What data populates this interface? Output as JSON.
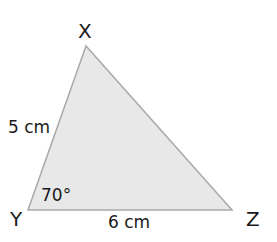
{
  "diagram": {
    "type": "triangle",
    "fill_color": "#e8e8e8",
    "stroke_color": "#a9a9a9",
    "text_color": "#1a1a1a",
    "vertices": [
      {
        "name": "X",
        "label": "X"
      },
      {
        "name": "Y",
        "label": "Y"
      },
      {
        "name": "Z",
        "label": "Z"
      }
    ],
    "sides": [
      {
        "between": "XY",
        "label": "5 cm"
      },
      {
        "between": "YZ",
        "label": "6 cm"
      }
    ],
    "angles": [
      {
        "at": "Y",
        "label": "70°"
      }
    ]
  }
}
